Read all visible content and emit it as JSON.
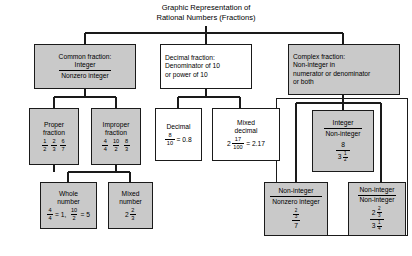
{
  "title": {
    "line1": "Graphic Representation of",
    "line2": "Rational Numbers (Fractions)"
  },
  "nodes": {
    "common_fraction": {
      "header": "Common fraction:",
      "num": "Integer",
      "den": "Nonzero integer"
    },
    "decimal_fraction": {
      "line1": "Decimal fraction:",
      "line2": "Denominator of 10",
      "line3": "or power of 10"
    },
    "complex_fraction": {
      "line1": "Complex fraction:",
      "line2": "Non-integer in",
      "line3": "numerator or denominator",
      "line4": "or both"
    },
    "proper_fraction": {
      "line1": "Proper",
      "line2": "fraction",
      "examples": [
        {
          "num": "1",
          "den": "2",
          "sep": ","
        },
        {
          "num": "2",
          "den": "3",
          "sep": ","
        },
        {
          "num": "6",
          "den": "7",
          "sep": ""
        }
      ]
    },
    "improper_fraction": {
      "line1": "Improper",
      "line2": "fraction",
      "examples": [
        {
          "num": "4",
          "den": "4",
          "sep": ","
        },
        {
          "num": "10",
          "den": "2",
          "sep": ","
        },
        {
          "num": "8",
          "den": "3",
          "sep": ""
        }
      ]
    },
    "decimal": {
      "label": "Decimal",
      "num": "8",
      "den": "10",
      "equals": "= 0.8"
    },
    "mixed_decimal": {
      "line1": "Mixed",
      "line2": "decimal",
      "whole": "2",
      "num": "17",
      "den": "100",
      "equals": "= 2.17"
    },
    "integer_over_noninteger": {
      "num": "Integer",
      "den": "Non-integer",
      "ex_num": "8",
      "ex_den_whole": "3",
      "ex_den_num": "1",
      "ex_den_den": "2"
    },
    "whole_number": {
      "line1": "Whole",
      "line2": "number",
      "examples": [
        {
          "num": "4",
          "den": "4",
          "equals": "= 1,",
          "sep": ""
        },
        {
          "num": "10",
          "den": "2",
          "equals": "= 5",
          "sep": ""
        }
      ]
    },
    "mixed_number": {
      "line1": "Mixed",
      "line2": "number",
      "whole": "2",
      "num": "2",
      "den": "3"
    },
    "noninteger_over_nonzero": {
      "num": "Non-integer",
      "den": "Nonzero integer",
      "ex_num_num": "2",
      "ex_num_den": "3",
      "ex_den": "7"
    },
    "noninteger_over_noninteger": {
      "num": "Non-integer",
      "den": "Non-integer",
      "ex_num_whole": "2",
      "ex_num_num": "2",
      "ex_num_den": "3",
      "ex_den_whole": "3",
      "ex_den_num": "1",
      "ex_den_den": "4"
    }
  },
  "colors": {
    "box_fill": "#c9c9c9",
    "box_white": "#ffffff",
    "stroke": "#1a1a1a",
    "background": "#ffffff"
  }
}
